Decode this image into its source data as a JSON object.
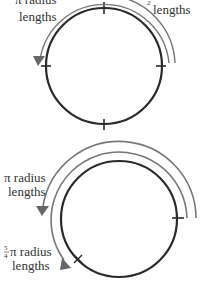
{
  "colors": {
    "circle": "#2a2a2a",
    "arc": "#777777",
    "text": "#333333",
    "background": "#ffffff"
  },
  "top_diagram": {
    "left_label": {
      "line1": "π radius",
      "line2": "lengths"
    },
    "right_label": {
      "prefix_fraction": "2",
      "line2": "lengths"
    },
    "ticks": [
      "top",
      "right",
      "bottom",
      "left"
    ]
  },
  "bottom_diagram": {
    "outer_label": {
      "line1": "π radius",
      "line2": "lengths"
    },
    "inner_label": {
      "fraction_num": "5",
      "fraction_den": "4",
      "line1": "π radius",
      "line2": "lengths"
    },
    "markers": {
      "tick": "right",
      "x_mark": "lower-left"
    }
  }
}
